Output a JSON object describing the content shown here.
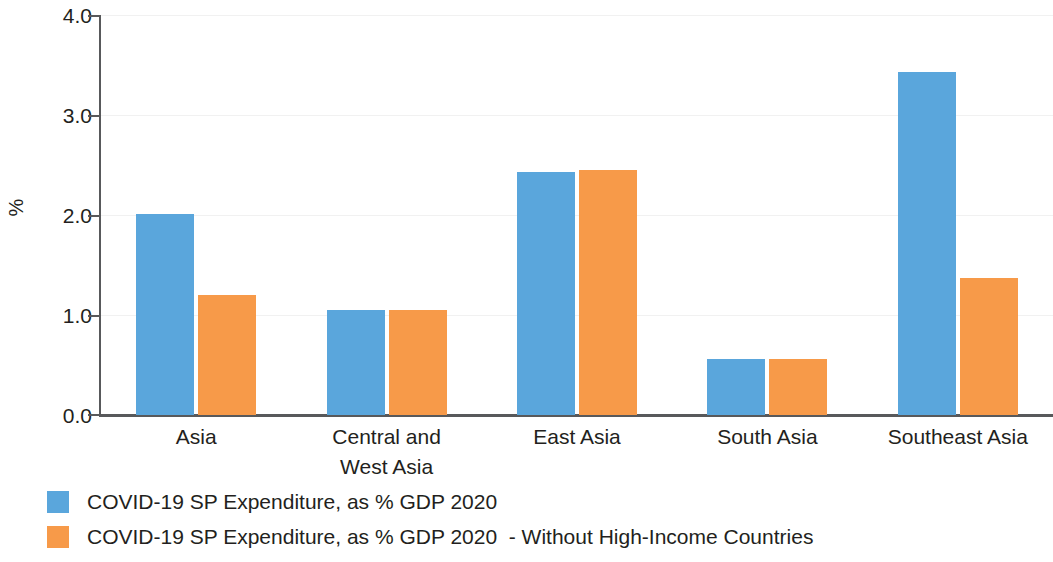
{
  "chart_data": {
    "type": "bar",
    "title": "",
    "subtitle": "",
    "xlabel": "",
    "ylabel": "%",
    "ylim": [
      0.0,
      4.0
    ],
    "ytick_labels": [
      "0.0",
      "1.0",
      "2.0",
      "3.0",
      "4.0"
    ],
    "ytick_values": [
      0.0,
      1.0,
      2.0,
      3.0,
      4.0
    ],
    "grid": true,
    "legend_position": "bottom-left",
    "categories": [
      "Asia",
      "Central and\nWest Asia",
      "East Asia",
      "South Asia",
      "Southeast Asia"
    ],
    "category_lines": [
      [
        "Asia"
      ],
      [
        "Central and",
        "West Asia"
      ],
      [
        "East Asia"
      ],
      [
        "South Asia"
      ],
      [
        "Southeast Asia"
      ]
    ],
    "series": [
      {
        "name": "COVID-19 SP Expenditure, as % GDP 2020",
        "color": "#5aa6dc",
        "values": [
          2.01,
          1.05,
          2.43,
          0.56,
          3.43
        ]
      },
      {
        "name": "COVID-19 SP Expenditure, as % GDP 2020  - Without High-Income Countries",
        "color": "#f79a49",
        "values": [
          1.2,
          1.05,
          2.45,
          0.56,
          1.37
        ]
      }
    ]
  },
  "axis": {
    "y_title": "%",
    "y_ticks": [
      "4.0",
      "3.0",
      "2.0",
      "1.0",
      "0.0"
    ]
  },
  "legend": {
    "items": [
      {
        "label": "COVID-19 SP Expenditure, as % GDP 2020",
        "color": "#5aa6dc"
      },
      {
        "label": "COVID-19 SP Expenditure, as % GDP 2020  - Without High-Income Countries",
        "color": "#f79a49"
      }
    ]
  },
  "colors": {
    "series_blue": "#5aa6dc",
    "series_orange": "#f79a49",
    "axis": "#58595b",
    "text": "#231f20",
    "grid": "#f1f1f1",
    "background": "#ffffff"
  }
}
